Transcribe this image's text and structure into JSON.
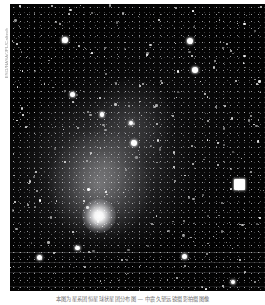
{
  "page": {
    "background_color": "#ffffff",
    "width": 265,
    "height": 305
  },
  "credit": {
    "text": "ESO/NASA/JPL/Caltech",
    "orientation": "vertical-rotated-90ccw",
    "color": "#8e8e8e"
  },
  "photo": {
    "alt_name": "deep-sky-astronomical-photograph",
    "background_color": "#030303",
    "description": "Dense star field with diffuse nebulous glow and a bright saturated nucleus toward lower left"
  },
  "caption": {
    "text": "本图为星系团恒星球状星团分布图 — 中震久望远镜摄影拍摄图像",
    "color": "#6f6f6f"
  },
  "sky_objects": {
    "nucleus": {
      "name": "bright-nucleus",
      "x_pct": 35,
      "y_pct": 74,
      "size": 34
    },
    "halo_center": {
      "x_pct": 38,
      "y_pct": 58
    },
    "bright_stars": [
      {
        "x_pct": 90.0,
        "y_pct": 63.0,
        "size": 11,
        "shape": "blocky",
        "label": "saturated-star-right"
      },
      {
        "x_pct": 21.5,
        "y_pct": 12.5,
        "size": 5.5,
        "shape": "round"
      },
      {
        "x_pct": 70.5,
        "y_pct": 13.0,
        "size": 6.0,
        "shape": "round"
      },
      {
        "x_pct": 72.5,
        "y_pct": 23.0,
        "size": 5.5,
        "shape": "round"
      },
      {
        "x_pct": 48.5,
        "y_pct": 48.5,
        "size": 6.0,
        "shape": "round"
      },
      {
        "x_pct": 47.5,
        "y_pct": 41.5,
        "size": 4.5,
        "shape": "round"
      },
      {
        "x_pct": 24.5,
        "y_pct": 31.5,
        "size": 5.0,
        "shape": "round"
      },
      {
        "x_pct": 11.5,
        "y_pct": 88.5,
        "size": 5.0,
        "shape": "round"
      },
      {
        "x_pct": 68.5,
        "y_pct": 88.0,
        "size": 5.0,
        "shape": "round"
      },
      {
        "x_pct": 26.5,
        "y_pct": 85.0,
        "size": 4.5,
        "shape": "round"
      },
      {
        "x_pct": 36.0,
        "y_pct": 38.5,
        "size": 4.5,
        "shape": "round"
      },
      {
        "x_pct": 87.5,
        "y_pct": 97.0,
        "size": 4.0,
        "shape": "round"
      }
    ],
    "streak_count": 4
  }
}
